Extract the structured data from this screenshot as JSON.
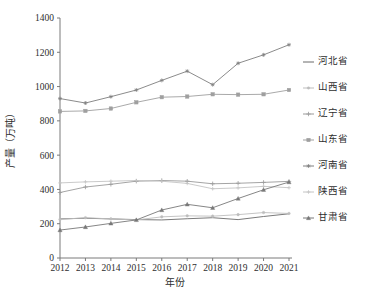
{
  "chart_data": {
    "type": "line",
    "title": "",
    "xlabel": "年份",
    "ylabel": "产量（万吨）",
    "categories": [
      "2012",
      "2013",
      "2014",
      "2015",
      "2016",
      "2017",
      "2018",
      "2019",
      "2020",
      "2021"
    ],
    "x": [
      2012,
      2013,
      2014,
      2015,
      2016,
      2017,
      2018,
      2019,
      2020,
      2021
    ],
    "xlim": [
      2012,
      2021
    ],
    "ylim": [
      0,
      1400
    ],
    "yticks": [
      0,
      200,
      400,
      600,
      800,
      1000,
      1200,
      1400
    ],
    "grid": false,
    "legend_position": "right",
    "series": [
      {
        "name": "河北省",
        "marker": "none",
        "color": "#6b6b6b",
        "values": [
          228,
          232,
          228,
          224,
          222,
          229,
          235,
          224,
          242,
          258
        ]
      },
      {
        "name": "山西省",
        "marker": "dot",
        "color": "#bdbdbd",
        "values": [
          225,
          235,
          228,
          222,
          240,
          246,
          244,
          253,
          265,
          260
        ]
      },
      {
        "name": "辽宁省",
        "marker": "plus",
        "color": "#9a9a9a",
        "values": [
          382,
          414,
          430,
          448,
          452,
          448,
          433,
          436,
          441,
          447
        ]
      },
      {
        "name": "山东省",
        "marker": "square",
        "color": "#9f9f9f",
        "values": [
          855,
          858,
          872,
          908,
          938,
          942,
          955,
          953,
          955,
          980
        ]
      },
      {
        "name": "河南省",
        "marker": "star",
        "color": "#7e7e7e",
        "values": [
          930,
          904,
          941,
          980,
          1036,
          1090,
          1011,
          1136,
          1185,
          1244
        ]
      },
      {
        "name": "陕西省",
        "marker": "plus-small",
        "color": "#c4c4c4",
        "values": [
          438,
          444,
          448,
          452,
          448,
          435,
          404,
          409,
          418,
          410
        ]
      },
      {
        "name": "甘肃省",
        "marker": "triangle",
        "color": "#787878",
        "values": [
          163,
          181,
          202,
          222,
          280,
          313,
          293,
          347,
          398,
          443
        ]
      }
    ]
  },
  "axes": {
    "y_tick_labels": [
      "0",
      "200",
      "400",
      "600",
      "800",
      "1000",
      "1200",
      "1400"
    ],
    "x_tick_labels": [
      "2012",
      "2013",
      "2014",
      "2015",
      "2016",
      "2017",
      "2018",
      "2019",
      "2020",
      "2021"
    ],
    "y_axis_title": "产量（万吨）",
    "x_axis_title": "年份"
  },
  "legend": {
    "items": [
      {
        "label": "河北省"
      },
      {
        "label": "山西省"
      },
      {
        "label": "辽宁省"
      },
      {
        "label": "山东省"
      },
      {
        "label": "河南省"
      },
      {
        "label": "陕西省"
      },
      {
        "label": "甘肃省"
      }
    ]
  }
}
